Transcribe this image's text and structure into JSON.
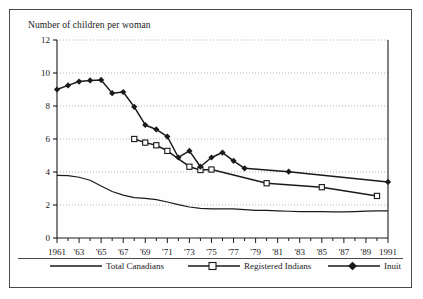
{
  "chart_data": {
    "type": "line",
    "title": "Number of children per woman",
    "xlabel": "",
    "ylabel": "",
    "ylim": [
      0,
      12
    ],
    "xlim": [
      1961,
      1991
    ],
    "yticks": [
      0,
      2,
      4,
      6,
      8,
      10,
      12
    ],
    "ytick_labels": [
      "0",
      "2",
      "4",
      "6",
      "8",
      "10",
      "12"
    ],
    "xticks": [
      1961,
      1962,
      1963,
      1964,
      1965,
      1966,
      1967,
      1968,
      1969,
      1970,
      1971,
      1972,
      1973,
      1974,
      1975,
      1976,
      1977,
      1978,
      1979,
      1980,
      1981,
      1982,
      1983,
      1984,
      1985,
      1986,
      1987,
      1988,
      1989,
      1990,
      1991
    ],
    "xtick_labels": [
      {
        "x": 1961,
        "label": "1961"
      },
      {
        "x": 1963,
        "label": "'63"
      },
      {
        "x": 1965,
        "label": "'65"
      },
      {
        "x": 1967,
        "label": "'67"
      },
      {
        "x": 1969,
        "label": "'69"
      },
      {
        "x": 1971,
        "label": "'71"
      },
      {
        "x": 1973,
        "label": "'73"
      },
      {
        "x": 1975,
        "label": "'75"
      },
      {
        "x": 1977,
        "label": "'77"
      },
      {
        "x": 1979,
        "label": "'79"
      },
      {
        "x": 1981,
        "label": "'81"
      },
      {
        "x": 1983,
        "label": "'83"
      },
      {
        "x": 1985,
        "label": "'85"
      },
      {
        "x": 1987,
        "label": "'87"
      },
      {
        "x": 1989,
        "label": "'89"
      },
      {
        "x": 1991,
        "label": "1991"
      }
    ],
    "grid": "horizontal-dotted",
    "legend_position": "bottom",
    "series": [
      {
        "name": "Total Canadians",
        "marker": "none",
        "color": "#1a1a1a",
        "points": [
          [
            1961,
            3.8
          ],
          [
            1962,
            3.78
          ],
          [
            1963,
            3.68
          ],
          [
            1964,
            3.5
          ],
          [
            1965,
            3.15
          ],
          [
            1966,
            2.82
          ],
          [
            1967,
            2.6
          ],
          [
            1968,
            2.45
          ],
          [
            1969,
            2.4
          ],
          [
            1970,
            2.33
          ],
          [
            1971,
            2.18
          ],
          [
            1972,
            2.02
          ],
          [
            1973,
            1.88
          ],
          [
            1974,
            1.8
          ],
          [
            1975,
            1.76
          ],
          [
            1976,
            1.76
          ],
          [
            1977,
            1.76
          ],
          [
            1978,
            1.72
          ],
          [
            1979,
            1.68
          ],
          [
            1980,
            1.67
          ],
          [
            1981,
            1.65
          ],
          [
            1982,
            1.62
          ],
          [
            1983,
            1.6
          ],
          [
            1984,
            1.6
          ],
          [
            1985,
            1.6
          ],
          [
            1986,
            1.58
          ],
          [
            1987,
            1.58
          ],
          [
            1988,
            1.6
          ],
          [
            1989,
            1.63
          ],
          [
            1990,
            1.65
          ],
          [
            1991,
            1.65
          ]
        ]
      },
      {
        "name": "Registered Indians",
        "marker": "open-square",
        "color": "#1a1a1a",
        "points": [
          [
            1968,
            6.0
          ],
          [
            1969,
            5.78
          ],
          [
            1970,
            5.62
          ],
          [
            1971,
            5.28
          ],
          [
            1973,
            4.32
          ],
          [
            1974,
            4.12
          ],
          [
            1975,
            4.15
          ],
          [
            1980,
            3.32
          ],
          [
            1985,
            3.08
          ],
          [
            1990,
            2.55
          ]
        ]
      },
      {
        "name": "Inuit",
        "marker": "filled-diamond",
        "color": "#1a1a1a",
        "points": [
          [
            1961,
            9.0
          ],
          [
            1962,
            9.25
          ],
          [
            1963,
            9.48
          ],
          [
            1964,
            9.55
          ],
          [
            1965,
            9.58
          ],
          [
            1966,
            8.78
          ],
          [
            1967,
            8.85
          ],
          [
            1968,
            7.95
          ],
          [
            1969,
            6.85
          ],
          [
            1970,
            6.58
          ],
          [
            1971,
            6.15
          ],
          [
            1972,
            4.88
          ],
          [
            1973,
            5.28
          ],
          [
            1974,
            4.32
          ],
          [
            1975,
            4.88
          ],
          [
            1976,
            5.18
          ],
          [
            1977,
            4.68
          ],
          [
            1978,
            4.22
          ],
          [
            1982,
            4.02
          ],
          [
            1991,
            3.4
          ]
        ]
      }
    ]
  },
  "legend": {
    "items": [
      {
        "label": "Total Canadians"
      },
      {
        "label": "Registered Indians"
      },
      {
        "label": "Inuit"
      }
    ]
  }
}
